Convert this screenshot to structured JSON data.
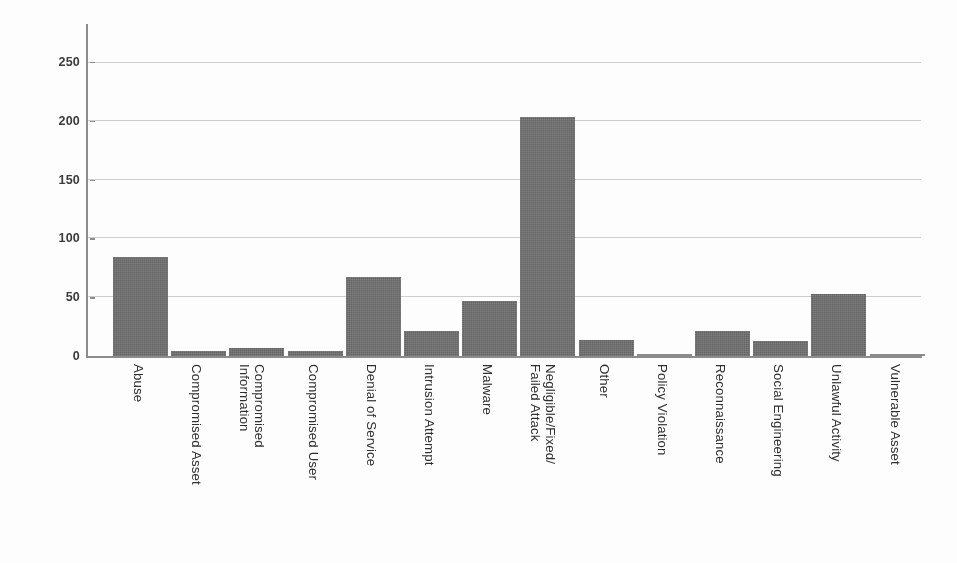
{
  "chart_data": {
    "type": "bar",
    "title": "",
    "subtitle": "",
    "xlabel": "",
    "ylabel": "",
    "ylim": [
      0,
      270
    ],
    "yticks": [
      0,
      50,
      100,
      150,
      200,
      250
    ],
    "ytick_labels": [
      "0",
      "50",
      "100",
      "150",
      "200",
      "250"
    ],
    "grid": "horizontal",
    "legend": "none",
    "bar_color": "#717171",
    "gridline_color": "#c8c8c8",
    "axis_color": "#8d8d8d",
    "categories": [
      "Abuse",
      "Compromised Asset",
      "Compromised\nInformation",
      "Compromised User",
      "Denial of Service",
      "Intrusion Attempt",
      "Malware",
      "Negligible/Fixed/\nFailed Attack",
      "Other",
      "Policy Violation",
      "Reconnaissance",
      "Social Engineering",
      "Unlawful Activity",
      "Vulnerable Asset"
    ],
    "values": [
      84,
      4,
      7,
      4,
      67,
      21,
      47,
      203,
      14,
      0,
      21,
      13,
      53,
      0
    ]
  }
}
